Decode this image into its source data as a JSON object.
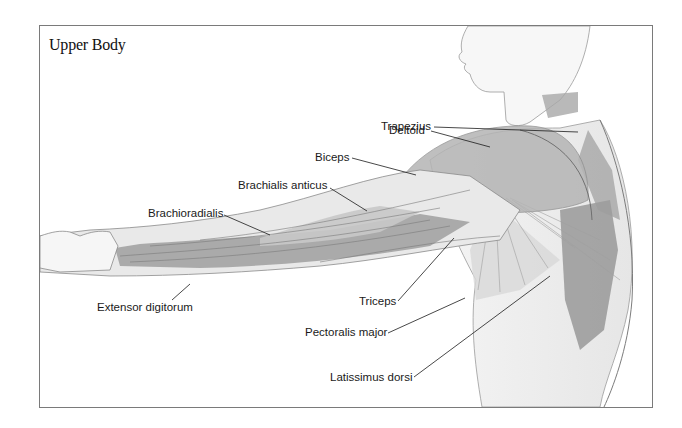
{
  "figure": {
    "title": "Upper Body",
    "frame_color": "#7a7a7a",
    "ink_color": "#1a1a1a",
    "muscle_shade": "#8e8e8e"
  },
  "labels": [
    {
      "id": "trapezius",
      "text": "Trapezius",
      "x": 381,
      "y": 121,
      "line": [
        434,
        127,
        578,
        132
      ]
    },
    {
      "id": "deltoid",
      "text": "Deltoid",
      "x": 389,
      "y": 125,
      "line": [
        431,
        131,
        490,
        147
      ]
    },
    {
      "id": "biceps",
      "text": "Biceps",
      "x": 315,
      "y": 152,
      "line": [
        352,
        158,
        416,
        175
      ]
    },
    {
      "id": "brachialis-anticus",
      "text": "Brachialis anticus",
      "x": 238,
      "y": 180,
      "line": [
        330,
        188,
        367,
        211
      ]
    },
    {
      "id": "brachioradialis",
      "text": "Brachioradialis",
      "x": 148,
      "y": 208,
      "line": [
        224,
        215,
        270,
        235
      ]
    },
    {
      "id": "extensor-digitorum",
      "text": "Extensor digitorum",
      "x": 97,
      "y": 302,
      "line": [
        172,
        300,
        190,
        284
      ]
    },
    {
      "id": "triceps",
      "text": "Triceps",
      "x": 359,
      "y": 296,
      "line": [
        398,
        301,
        454,
        238
      ]
    },
    {
      "id": "pectoralis-major",
      "text": "Pectoralis major",
      "x": 305,
      "y": 327,
      "line": [
        388,
        333,
        465,
        298
      ]
    },
    {
      "id": "latissimus-dorsi",
      "text": "Latissimus dorsi",
      "x": 330,
      "y": 372,
      "line": [
        414,
        377,
        550,
        276
      ]
    }
  ]
}
